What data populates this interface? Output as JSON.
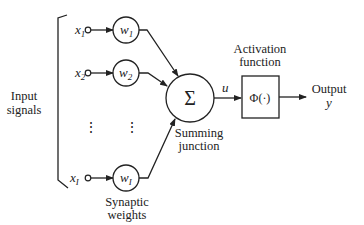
{
  "diagram": {
    "inputs_label": [
      "Input",
      "signals"
    ],
    "inputs": [
      {
        "var": "x",
        "sub": "1",
        "weight": "w",
        "wsub": "1"
      },
      {
        "var": "x",
        "sub": "2",
        "weight": "w",
        "wsub": "2"
      },
      {
        "var": "x",
        "sub": "I",
        "weight": "w",
        "wsub": "I"
      }
    ],
    "ellipsis": "⋮",
    "weights_label": [
      "Synaptic",
      "weights"
    ],
    "summing_symbol": "Σ",
    "summing_label": [
      "Summing",
      "junction"
    ],
    "sum_output": "u",
    "activation_label": [
      "Activation",
      "function"
    ],
    "activation_symbol": "Φ(·)",
    "output_label": [
      "Output",
      "y"
    ]
  }
}
